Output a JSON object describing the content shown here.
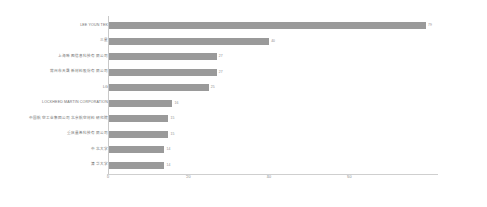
{
  "chart_data": {
    "type": "bar",
    "orientation": "horizontal",
    "title": "",
    "subtitle": "",
    "xlabel": "",
    "ylabel": "",
    "xlim": [
      0,
      82
    ],
    "xticks": [
      "0",
      "20",
      "40",
      "60"
    ],
    "xtick_values": [
      0,
      20,
      40,
      60
    ],
    "grid": false,
    "legend": null,
    "bar_color": "#9a9a9a",
    "axis_color": "#c8c8c8",
    "label_color": "#6e6e6e",
    "categories": [
      "LEE YOUN TEK",
      "三星",
      "上海晰图信息科技有限公司",
      "常州市天晟新材料股份有限公司",
      "LG",
      "LOCKHEED MARTIN CORPORATION",
      "中国航空工业集团公司北京航空材料研究院",
      "重庆墨希科技有限公司",
      "中北大学",
      "清华大学"
    ],
    "values": [
      79,
      40,
      27,
      27,
      25,
      16,
      15,
      15,
      14,
      14
    ],
    "value_labels": [
      "79",
      "40",
      "27",
      "27",
      "25",
      "16",
      "15",
      "15",
      "14",
      "14"
    ]
  }
}
